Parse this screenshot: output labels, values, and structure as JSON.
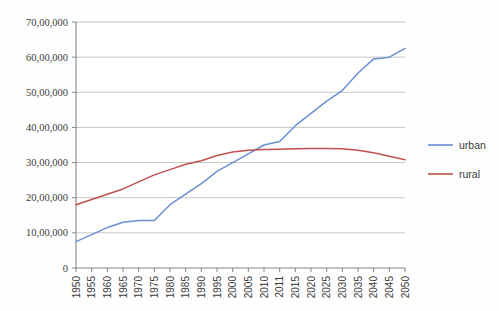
{
  "title_strip": "",
  "chart_data": {
    "type": "line",
    "title": "",
    "subtitle": "",
    "xlabel": "",
    "ylabel": "",
    "x": [
      "1950",
      "1955",
      "1960",
      "1965",
      "1970",
      "1975",
      "1980",
      "1985",
      "1990",
      "1995",
      "2000",
      "2005",
      "2010",
      "2011",
      "2015",
      "2020",
      "2025",
      "2030",
      "2035",
      "2040",
      "2045",
      "2050"
    ],
    "categories": [
      "1950",
      "1955",
      "1960",
      "1965",
      "1970",
      "1975",
      "1980",
      "1985",
      "1990",
      "1995",
      "2000",
      "2005",
      "2010",
      "2011",
      "2015",
      "2020",
      "2025",
      "2030",
      "2035",
      "2040",
      "2045",
      "2050"
    ],
    "series": [
      {
        "name": "urban",
        "color": "#6A8FD4",
        "values": [
          750000,
          950000,
          1150000,
          1300000,
          1350000,
          1350000,
          1800000,
          2100000,
          2400000,
          2750000,
          3000000,
          3250000,
          3500000,
          3600000,
          4050000,
          4400000,
          4750000,
          5050000,
          5550000,
          5950000,
          6000000,
          6250000
        ]
      },
      {
        "name": "rural",
        "color": "#C0504D",
        "values": [
          1800000,
          1950000,
          2100000,
          2250000,
          2450000,
          2650000,
          2800000,
          2950000,
          3050000,
          3200000,
          3300000,
          3350000,
          3370000,
          3380000,
          3390000,
          3400000,
          3400000,
          3390000,
          3350000,
          3280000,
          3180000,
          3080000
        ]
      }
    ],
    "ylim": [
      0,
      7000000
    ],
    "yticks": [
      0,
      1000000,
      2000000,
      3000000,
      4000000,
      5000000,
      6000000,
      7000000
    ],
    "ytick_labels": [
      "0",
      "10,00,000",
      "20,00,000",
      "30,00,000",
      "40,00,000",
      "50,00,000",
      "60,00,000",
      "70,00,000"
    ],
    "grid": true,
    "grid_axis": "y",
    "grid_color": "#BFBFBF",
    "axis_color": "#868686",
    "legend": true,
    "legend_position": "right",
    "legend_entries": [
      {
        "label": "urban",
        "color": "#6A8FD4"
      },
      {
        "label": "rural",
        "color": "#C0504D"
      }
    ],
    "background": "#FEFEFE",
    "plot_background": "#FFFFFF"
  }
}
